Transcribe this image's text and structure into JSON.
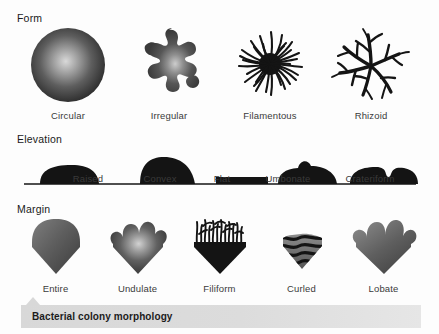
{
  "figure": {
    "caption": "Bacterial colony morphology",
    "colors": {
      "colony_dark": "#3f3f3f",
      "colony_light": "#cfcfcf",
      "ink": "#141414",
      "caption_bar": "#d8d8d8",
      "label_text": "#3a3a3a",
      "background": "#fdfdfd"
    }
  },
  "sections": [
    {
      "name": "form",
      "title": "Form",
      "items": [
        {
          "label": "Circular",
          "icon": "circular-colony-icon"
        },
        {
          "label": "Irregular",
          "icon": "irregular-colony-icon"
        },
        {
          "label": "Filamentous",
          "icon": "filamentous-colony-icon"
        },
        {
          "label": "Rhizoid",
          "icon": "rhizoid-colony-icon"
        }
      ]
    },
    {
      "name": "elevation",
      "title": "Elevation",
      "items": [
        {
          "label": "Raised",
          "icon": "raised-profile-icon",
          "x": 88
        },
        {
          "label": "Convex",
          "icon": "convex-profile-icon",
          "x": 160
        },
        {
          "label": "Flat",
          "icon": "flat-profile-icon",
          "x": 222
        },
        {
          "label": "Umbonate",
          "icon": "umbonate-profile-icon",
          "x": 288
        },
        {
          "label": "Crateriform",
          "icon": "crateriform-profile-icon",
          "x": 370
        }
      ]
    },
    {
      "name": "margin",
      "title": "Margin",
      "items": [
        {
          "label": "Entire",
          "icon": "entire-margin-icon"
        },
        {
          "label": "Undulate",
          "icon": "undulate-margin-icon"
        },
        {
          "label": "Filiform",
          "icon": "filiform-margin-icon"
        },
        {
          "label": "Curled",
          "icon": "curled-margin-icon"
        },
        {
          "label": "Lobate",
          "icon": "lobate-margin-icon"
        }
      ]
    }
  ]
}
